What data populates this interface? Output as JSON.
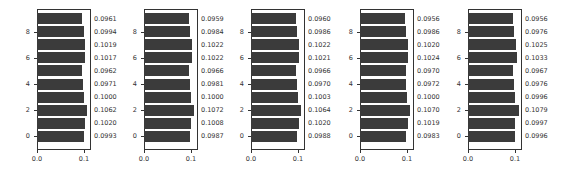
{
  "chart_data": [
    {
      "type": "bar",
      "orientation": "horizontal",
      "categories": [
        0,
        1,
        2,
        3,
        4,
        5,
        6,
        7,
        8,
        9
      ],
      "values": [
        0.0993,
        0.102,
        0.1062,
        0.1,
        0.0971,
        0.0962,
        0.1017,
        0.1019,
        0.0994,
        0.0961
      ],
      "labels": [
        "0.0993",
        "0.1020",
        "0.1062",
        "0.1000",
        "0.0971",
        "0.0962",
        "0.1017",
        "0.1019",
        "0.0994",
        "0.0961"
      ],
      "yticks": [
        "0",
        "2",
        "4",
        "6",
        "8"
      ],
      "xticks": [
        "0.0",
        "0.1"
      ],
      "xlim": [
        0,
        0.11
      ],
      "title": "",
      "xlabel": "",
      "ylabel": ""
    },
    {
      "type": "bar",
      "orientation": "horizontal",
      "categories": [
        0,
        1,
        2,
        3,
        4,
        5,
        6,
        7,
        8,
        9
      ],
      "values": [
        0.0987,
        0.1008,
        0.1072,
        0.1,
        0.0981,
        0.0966,
        0.1022,
        0.1022,
        0.0984,
        0.0959
      ],
      "labels": [
        "0.0987",
        "0.1008",
        "0.1072",
        "0.1000",
        "0.0981",
        "0.0966",
        "0.1022",
        "0.1022",
        "0.0984",
        "0.0959"
      ],
      "yticks": [
        "0",
        "2",
        "4",
        "6",
        "8"
      ],
      "xticks": [
        "0.0",
        "0.1"
      ],
      "xlim": [
        0,
        0.11
      ],
      "title": "",
      "xlabel": "",
      "ylabel": ""
    },
    {
      "type": "bar",
      "orientation": "horizontal",
      "categories": [
        0,
        1,
        2,
        3,
        4,
        5,
        6,
        7,
        8,
        9
      ],
      "values": [
        0.0988,
        0.102,
        0.1064,
        0.1003,
        0.097,
        0.0966,
        0.1021,
        0.1022,
        0.0986,
        0.096
      ],
      "labels": [
        "0.0988",
        "0.1020",
        "0.1064",
        "0.1003",
        "0.0970",
        "0.0966",
        "0.1021",
        "0.1022",
        "0.0986",
        "0.0960"
      ],
      "yticks": [
        "0",
        "2",
        "4",
        "6",
        "8"
      ],
      "xticks": [
        "0.0",
        "0.1"
      ],
      "xlim": [
        0,
        0.11
      ],
      "title": "",
      "xlabel": "",
      "ylabel": ""
    },
    {
      "type": "bar",
      "orientation": "horizontal",
      "categories": [
        0,
        1,
        2,
        3,
        4,
        5,
        6,
        7,
        8,
        9
      ],
      "values": [
        0.0983,
        0.1019,
        0.107,
        0.1,
        0.0972,
        0.097,
        0.1024,
        0.102,
        0.0986,
        0.0956
      ],
      "labels": [
        "0.0983",
        "0.1019",
        "0.1070",
        "0.1000",
        "0.0972",
        "0.0970",
        "0.1024",
        "0.1020",
        "0.0986",
        "0.0956"
      ],
      "yticks": [
        "0",
        "2",
        "4",
        "6",
        "8"
      ],
      "xticks": [
        "0.0",
        "0.1"
      ],
      "xlim": [
        0,
        0.11
      ],
      "title": "",
      "xlabel": "",
      "ylabel": ""
    },
    {
      "type": "bar",
      "orientation": "horizontal",
      "categories": [
        0,
        1,
        2,
        3,
        4,
        5,
        6,
        7,
        8,
        9
      ],
      "values": [
        0.0996,
        0.0997,
        0.1079,
        0.0996,
        0.0976,
        0.0967,
        0.1033,
        0.1025,
        0.0976,
        0.0956
      ],
      "labels": [
        "0.0996",
        "0.0997",
        "0.1079",
        "0.0996",
        "0.0976",
        "0.0967",
        "0.1033",
        "0.1025",
        "0.0976",
        "0.0956"
      ],
      "yticks": [
        "0",
        "2",
        "4",
        "6",
        "8"
      ],
      "xticks": [
        "0.0",
        "0.1"
      ],
      "xlim": [
        0,
        0.11
      ],
      "title": "",
      "xlabel": "",
      "ylabel": ""
    }
  ],
  "layout": {
    "panel_lefts": [
      37,
      144,
      251,
      360,
      468
    ],
    "bar_color": "#3b3b3b"
  }
}
